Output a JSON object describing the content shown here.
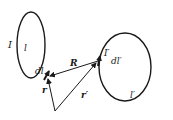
{
  "diagram": {
    "circuit_left": {
      "current_label": "I",
      "loop_label": "l",
      "element_label": "dl"
    },
    "circuit_right": {
      "current_label": "I′",
      "loop_label": "l′",
      "element_label": "dl′"
    },
    "vectors": {
      "R": "R",
      "r": "r",
      "r_prime": "r′"
    },
    "colors": {
      "stroke": "#1a1a1a",
      "background": "#ffffff"
    }
  }
}
